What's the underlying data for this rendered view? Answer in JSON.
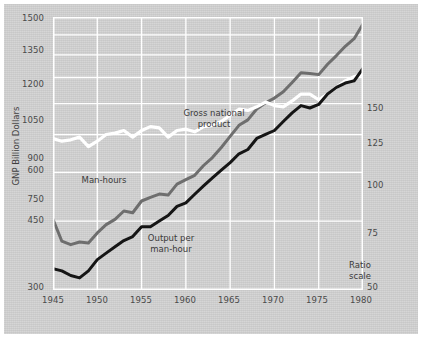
{
  "chart_data": {
    "type": "line",
    "title": "",
    "xlabel": "",
    "ylabel": "GNP Billion Dollars",
    "ylabel_right": "Man-hours and productivity : index 1968 = 100",
    "scale_note": "Ratio scale",
    "grid": true,
    "legend_position": "inline-annotations",
    "x": [
      1945,
      1946,
      1947,
      1948,
      1949,
      1950,
      1951,
      1952,
      1953,
      1954,
      1955,
      1956,
      1957,
      1958,
      1959,
      1960,
      1961,
      1962,
      1963,
      1964,
      1965,
      1966,
      1967,
      1968,
      1969,
      1970,
      1971,
      1972,
      1973,
      1974,
      1975,
      1976,
      1977,
      1978,
      1979,
      1980
    ],
    "xlim": [
      1945,
      1980
    ],
    "xticks": [
      "1945",
      "1950",
      "1955",
      "1960",
      "1965",
      "1970",
      "1975",
      "1980"
    ],
    "yticks_left": [
      "300",
      "450",
      "600",
      "750",
      "900",
      "1050",
      "1200",
      "1350",
      "1500"
    ],
    "ylim_left": [
      300,
      1500
    ],
    "yticks_right": [
      "50",
      "75",
      "100",
      "125",
      "150"
    ],
    "ylim_right": [
      50,
      150
    ],
    "series": [
      {
        "name": "Gross national product",
        "color": "#6e6e6e",
        "unit": "GNP Billion Dollars",
        "axis": "left",
        "values": [
          455,
          400,
          392,
          398,
          396,
          420,
          441,
          455,
          478,
          473,
          507,
          518,
          528,
          525,
          560,
          575,
          590,
          625,
          655,
          695,
          742,
          792,
          818,
          872,
          905,
          930,
          965,
          1020,
          1080,
          1075,
          1068,
          1135,
          1195,
          1262,
          1320,
          1440
        ]
      },
      {
        "name": "Man-hours",
        "color": "#ffffff",
        "unit": "index 1968 = 100",
        "axis": "right",
        "values": [
          92,
          91,
          91.5,
          92.5,
          89,
          91,
          93.5,
          94,
          95,
          92.5,
          95,
          96.5,
          96,
          92.5,
          95,
          95.5,
          94.5,
          96.5,
          97,
          98.5,
          101,
          103.5,
          103,
          104.5,
          106.5,
          105,
          104.5,
          107,
          110,
          110,
          107.5,
          110,
          113,
          116,
          118,
          119
        ]
      },
      {
        "name": "Output per man-hour",
        "color": "#151515",
        "unit": "index 1968 = 100",
        "axis": "right",
        "values": [
          54.5,
          54,
          53,
          52.5,
          54,
          56.5,
          58,
          59.5,
          61,
          62,
          64.5,
          64.5,
          66,
          67.5,
          70,
          71,
          73.5,
          76,
          78.5,
          81,
          83.5,
          86.5,
          88,
          92,
          93.5,
          95,
          98.5,
          102,
          105,
          104,
          105.5,
          110,
          113,
          115,
          116,
          122
        ]
      }
    ]
  },
  "annotations": {
    "gross_national_product": "Gross national\nproduct",
    "gnp_line1": "Gross national",
    "gnp_line2": "product",
    "man_hours": "Man-hours",
    "output_line1": "Output per",
    "output_line2": "man-hour",
    "ratio_line1": "Ratio",
    "ratio_line2": "scale"
  },
  "colors": {
    "background": "#d2d2d2",
    "grid": "#ffffff",
    "gnp": "#6e6e6e",
    "man_hours": "#ffffff",
    "output": "#151515",
    "text": "#4a4a4a"
  }
}
